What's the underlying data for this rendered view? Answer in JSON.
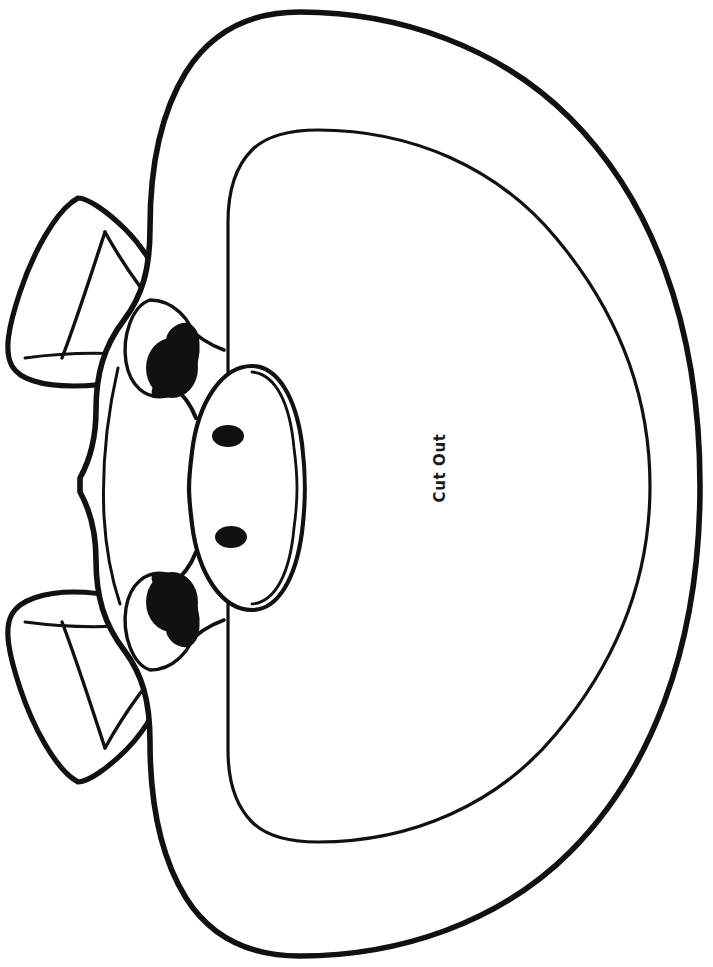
{
  "page": {
    "background_color": "#ffffff",
    "width": 713,
    "height": 967,
    "orientation": "portrait",
    "artwork_rotation_deg": 90
  },
  "labels": {
    "cut_out": "Cut Out"
  },
  "colors": {
    "ink": "#111111",
    "fill": "#ffffff",
    "pupil": "#111111",
    "label_text": "#1a1a1a"
  },
  "strokes": {
    "outer_outline_width": 5.5,
    "inner_cut_line_width": 3.2,
    "feature_line_width": 4.2,
    "detail_line_width": 2.6
  },
  "artwork": {
    "subject": "cow-pig-mask",
    "description": "Line-art animal face mask template shown rotated 90 degrees, with an outer head outline, an inner cut-out opening, two ears, two eyes with solid pupils and an oval snout with two nostrils.",
    "parts": [
      {
        "name": "head-outline",
        "type": "closed-path",
        "stroke": "#111111",
        "fill": "#ffffff"
      },
      {
        "name": "cut-out-opening",
        "type": "closed-path",
        "stroke": "#111111",
        "fill": "#ffffff"
      },
      {
        "name": "ear-top",
        "type": "closed-path",
        "stroke": "#111111",
        "fill": "#ffffff"
      },
      {
        "name": "ear-bottom",
        "type": "closed-path",
        "stroke": "#111111",
        "fill": "#ffffff"
      },
      {
        "name": "eye-top",
        "type": "closed-path",
        "stroke": "#111111",
        "fill": "#111111"
      },
      {
        "name": "eye-bottom",
        "type": "closed-path",
        "stroke": "#111111",
        "fill": "#111111"
      },
      {
        "name": "snout",
        "type": "closed-path",
        "stroke": "#111111",
        "fill": "#ffffff"
      },
      {
        "name": "nostril-upper",
        "type": "ellipse",
        "cx": 228,
        "cy": 436,
        "rx": 16,
        "ry": 11,
        "fill": "#111111"
      },
      {
        "name": "nostril-lower",
        "type": "ellipse",
        "cx": 231,
        "cy": 537,
        "rx": 16,
        "ry": 11,
        "fill": "#111111"
      }
    ]
  }
}
